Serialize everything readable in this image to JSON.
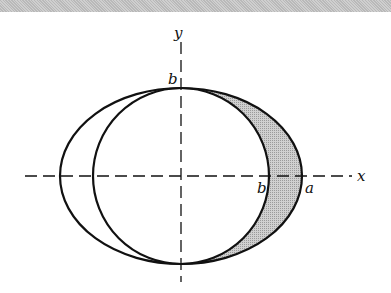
{
  "diagram": {
    "axes": {
      "x_label": "x",
      "y_label": "y",
      "style": "dashed"
    },
    "labels": {
      "b_top": "b",
      "b_axis": "b",
      "a_axis": "a"
    },
    "shapes": {
      "ellipse": {
        "semi_major": "a",
        "semi_minor": "b"
      },
      "circle": {
        "radius": "b"
      },
      "shaded_region": "right crescent between circle and ellipse"
    },
    "colors": {
      "stroke": "#111111",
      "shade": "#c4c4c4",
      "background": "#ffffff",
      "top_bar": "#c4c4c4"
    }
  }
}
